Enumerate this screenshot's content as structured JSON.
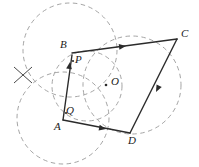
{
  "figure": {
    "width": 199,
    "height": 167,
    "background_color": "#ffffff",
    "solid_line_color": "#2b2b2b",
    "dashed_line_color": "#9a9a9a",
    "label_color": "#1a1a1a"
  },
  "points": [
    {
      "name": "B",
      "label": "B",
      "x": 72,
      "y": 53,
      "label_x": 60,
      "label_y": 39
    },
    {
      "name": "P",
      "label": "P",
      "x": 73,
      "y": 61,
      "label_x": 75,
      "label_y": 54
    },
    {
      "name": "C",
      "label": "C",
      "x": 177,
      "y": 39,
      "label_x": 181,
      "label_y": 28
    },
    {
      "name": "O",
      "label": "O",
      "x": 106,
      "y": 85,
      "label_x": 111,
      "label_y": 76
    },
    {
      "name": "Q",
      "label": "Q",
      "x": 66,
      "y": 113,
      "label_x": 66,
      "label_y": 105
    },
    {
      "name": "A",
      "label": "A",
      "x": 63,
      "y": 119,
      "label_x": 54,
      "label_y": 121
    },
    {
      "name": "D",
      "label": "D",
      "x": 130,
      "y": 133,
      "label_x": 128,
      "label_y": 135
    }
  ],
  "solid_segments": [
    {
      "name": "segment-B-C",
      "from": "B",
      "to": "C",
      "x1": 72,
      "y1": 53,
      "x2": 177,
      "y2": 39,
      "arrow_at": {
        "x": 126,
        "y": 46
      }
    },
    {
      "name": "segment-C-D",
      "from": "C",
      "to": "D",
      "x1": 177,
      "y1": 39,
      "x2": 130,
      "y2": 133,
      "arrow_at": {
        "x": 156,
        "y": 92
      }
    },
    {
      "name": "segment-A-D",
      "from": "A",
      "to": "D",
      "x1": 63,
      "y1": 120,
      "x2": 130,
      "y2": 133,
      "arrow_at": {
        "x": 106,
        "y": 129
      }
    },
    {
      "name": "segment-A-P",
      "from": "A",
      "to": "P",
      "x1": 63,
      "y1": 120,
      "x2": 72,
      "y2": 55,
      "arrow_at": {
        "x": 70,
        "y": 62
      }
    }
  ],
  "dashed_circles": [
    {
      "name": "circle-upper-left",
      "cx": 70,
      "cy": 50,
      "r": 47
    },
    {
      "name": "circle-lower-left",
      "cx": 63,
      "cy": 118,
      "r": 46
    },
    {
      "name": "circle-center",
      "cx": 87,
      "cy": 86,
      "r": 35
    },
    {
      "name": "circle-right",
      "cx": 132,
      "cy": 85,
      "r": 49
    }
  ],
  "tick_marks": [
    {
      "name": "tick-left-cross-stroke-1",
      "x1": 14,
      "y1": 67,
      "x2": 32,
      "y2": 83
    },
    {
      "name": "tick-left-cross-stroke-2",
      "x1": 32,
      "y1": 67,
      "x2": 14,
      "y2": 83
    }
  ]
}
